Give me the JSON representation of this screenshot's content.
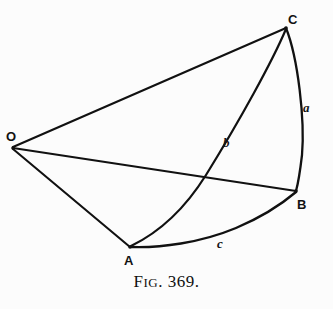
{
  "figure": {
    "caption_lead": "F",
    "caption_smallcaps": "IG",
    "caption_number": ". 369.",
    "caption_full": "FIG. 369.",
    "background_color": "#fcfcfc",
    "ink_color": "#111111"
  },
  "vertices": [
    {
      "id": "O",
      "label": "O",
      "x": 12,
      "y": 148,
      "label_x": 6,
      "label_y": 130
    },
    {
      "id": "C",
      "label": "C",
      "x": 286,
      "y": 27,
      "label_x": 288,
      "label_y": 13
    },
    {
      "id": "B",
      "label": "B",
      "x": 296,
      "y": 191,
      "label_x": 297,
      "label_y": 198
    },
    {
      "id": "A",
      "label": "A",
      "x": 130,
      "y": 246,
      "label_x": 124,
      "label_y": 254
    }
  ],
  "arcs": [
    {
      "id": "a",
      "label": "a",
      "from": "C",
      "to": "B",
      "label_x": 303,
      "label_y": 101
    },
    {
      "id": "b",
      "label": "b",
      "from": "C",
      "to": "A",
      "label_x": 223,
      "label_y": 136
    },
    {
      "id": "c",
      "label": "c",
      "from": "A",
      "to": "B",
      "label_x": 217,
      "label_y": 237
    }
  ],
  "edges": [
    {
      "id": "OC",
      "from": "O",
      "to": "C"
    },
    {
      "id": "OB",
      "from": "O",
      "to": "B"
    },
    {
      "id": "OA",
      "from": "O",
      "to": "A"
    }
  ],
  "geometry": {
    "arc_a_path": "M 286 28 C 298 58 305 120 302 155 C 300 172 298 184 296 191",
    "arc_b_path": "M 286 29 C 272 62 240 120 206 175 C 186 207 160 232 131 246",
    "arc_c_path": "M 131 247 C 160 248 200 243 236 228 C 262 217 283 203 296 192",
    "edge_OC_path": "M 13 147 L 286 28",
    "edge_OB_path": "M 13 148 L 296 191",
    "edge_OA_path": "M 13 149 L 130 247"
  }
}
